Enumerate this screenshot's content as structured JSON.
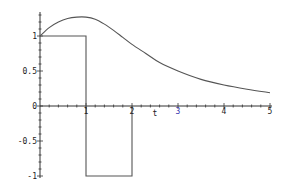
{
  "chart_data": {
    "type": "line",
    "title": "",
    "xlabel": "t",
    "ylabel": "",
    "xlim": [
      0,
      5
    ],
    "ylim": [
      -1,
      1.3
    ],
    "grid": false,
    "legend": null,
    "x_ticks": [
      "1",
      "2",
      "3",
      "4",
      "5"
    ],
    "y_ticks": [
      "1",
      "0.5",
      "0",
      "-0.5",
      "-1"
    ],
    "series": [
      {
        "name": "response",
        "x": [
          0,
          0.2,
          0.4,
          0.6,
          0.8,
          1.0,
          1.2,
          1.4,
          1.6,
          1.8,
          2.0,
          2.3,
          2.6,
          3.0,
          3.5,
          4.0,
          4.5,
          5.0
        ],
        "values": [
          1.0,
          1.12,
          1.2,
          1.25,
          1.27,
          1.27,
          1.24,
          1.17,
          1.08,
          0.98,
          0.88,
          0.75,
          0.62,
          0.5,
          0.38,
          0.3,
          0.24,
          0.19
        ]
      },
      {
        "name": "input pulse",
        "x": [
          0,
          1,
          1,
          2,
          2
        ],
        "values": [
          1,
          1,
          -1,
          -1,
          0
        ]
      }
    ]
  },
  "axis": {
    "t_label": "t"
  }
}
